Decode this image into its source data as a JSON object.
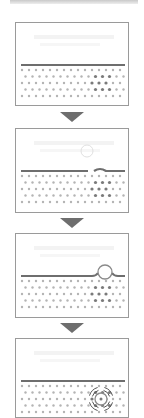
{
  "diagram": {
    "type": "sequential-process",
    "direction": "top-to-bottom",
    "colors": {
      "panel_border": "#9a9a9a",
      "surface_line": "#6e6e6e",
      "lattice_dot": "#b4b4b4",
      "cluster_dot": "#7a7a7a",
      "arrow": "#6e6e6e",
      "bubble": "#8a8a8a"
    },
    "panels": [
      {
        "step": 1,
        "description": "flat surface over dot lattice with dark cluster",
        "bubble": "none"
      },
      {
        "step": 2,
        "description": "faint bubble above surface, surface starting to deform",
        "bubble": "faint-above"
      },
      {
        "step": 3,
        "description": "bubble sitting in surface bump",
        "bubble": "on-surface"
      },
      {
        "step": 4,
        "description": "bubble embedded in lattice with vibration arcs",
        "bubble": "embedded-vibrating"
      }
    ],
    "arrows": [
      {
        "from": 1,
        "to": 2,
        "icon": "down-triangle-arrow"
      },
      {
        "from": 2,
        "to": 3,
        "icon": "down-triangle-arrow"
      },
      {
        "from": 3,
        "to": 4,
        "icon": "down-triangle-arrow"
      }
    ]
  }
}
